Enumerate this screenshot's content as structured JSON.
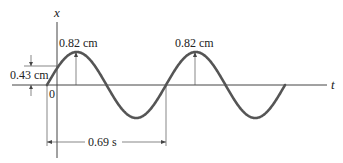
{
  "diagram": {
    "type": "sinusoidal displacement vs time",
    "vertical_axis_label": "x",
    "horizontal_axis_label": "t",
    "origin_label": "0",
    "amplitude_label_1": "0.82 cm",
    "amplitude_label_2": "0.82 cm",
    "initial_displacement_label": "0.43 cm",
    "period_label": "0.69 s",
    "values": {
      "amplitude_cm": 0.82,
      "initial_displacement_cm": 0.43,
      "period_s": 0.69,
      "cycles_shown": 2
    },
    "colors": {
      "curve": "#555555",
      "axes": "#444444",
      "text": "#222222"
    }
  }
}
